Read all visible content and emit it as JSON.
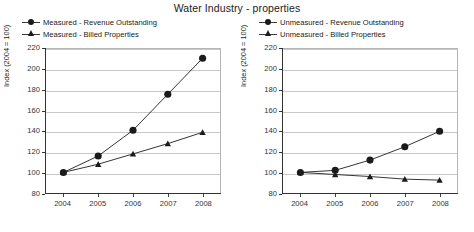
{
  "page_title": "Water Industry - properties",
  "chart_data": [
    {
      "type": "line",
      "panel": "left",
      "title": "",
      "xlabel": "",
      "ylabel": "Index (2004 = 100)",
      "categories": [
        "2004",
        "2005",
        "2006",
        "2007",
        "2008"
      ],
      "x": [
        2004,
        2005,
        2006,
        2007,
        2008
      ],
      "ylim": [
        80,
        220
      ],
      "yticks": [
        80,
        100,
        120,
        140,
        160,
        180,
        200,
        220
      ],
      "grid": true,
      "legend_position": "above",
      "series": [
        {
          "name": "Measured - Revenue Outstanding",
          "marker": "circle",
          "color": "#1b1b1b",
          "values": [
            100,
            116,
            141,
            176,
            211
          ]
        },
        {
          "name": "Measured - Billed Properties",
          "marker": "triangle",
          "color": "#1b1b1b",
          "values": [
            100,
            108,
            118,
            128,
            139
          ]
        }
      ]
    },
    {
      "type": "line",
      "panel": "right",
      "title": "",
      "xlabel": "",
      "ylabel": "Index (2004 = 100)",
      "categories": [
        "2004",
        "2005",
        "2006",
        "2007",
        "2008"
      ],
      "x": [
        2004,
        2005,
        2006,
        2007,
        2008
      ],
      "ylim": [
        80,
        220
      ],
      "yticks": [
        80,
        100,
        120,
        140,
        160,
        180,
        200,
        220
      ],
      "grid": true,
      "legend_position": "above",
      "series": [
        {
          "name": "Unmeasured - Revenue Outstanding",
          "marker": "circle",
          "color": "#1b1b1b",
          "values": [
            100,
            102,
            112,
            125,
            140
          ]
        },
        {
          "name": "Unmeasured - Billed Properties",
          "marker": "triangle",
          "color": "#1b1b1b",
          "values": [
            100,
            98,
            96,
            93.5,
            92.5
          ]
        }
      ]
    }
  ]
}
